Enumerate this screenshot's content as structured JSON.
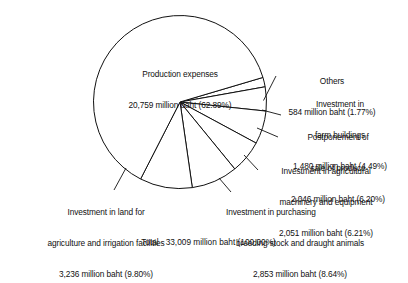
{
  "chart_data": {
    "type": "pie",
    "title": "",
    "unit": "million baht",
    "categories": [
      "Production expenses",
      "Others",
      "Investment in farm buildings",
      "Postponement of sale of produce",
      "Investment in agricultural machinery and equipment",
      "Investment in purchasing breeding stock and draught animals",
      "Investment in land for agriculture and irrigation facilities"
    ],
    "values": [
      20759,
      584,
      1480,
      2046,
      2051,
      2853,
      3236
    ],
    "percentages": [
      62.89,
      1.77,
      4.49,
      6.2,
      6.21,
      8.64,
      9.8
    ],
    "total_value": 33009,
    "total_percentage": 100.0,
    "legend": "none",
    "grid": false,
    "colors": {
      "slice_fill": "#ffffff",
      "outline": "#111111"
    }
  },
  "labels": {
    "production": {
      "line1": "Production expenses",
      "line2": "20,759 million baht (62.89%)"
    },
    "others": {
      "line1": "Others",
      "line2": "584 million baht (1.77%)"
    },
    "farm_buildings": {
      "line1": "Investment in",
      "line2": "farm buildings",
      "line3": "1,480 million baht (4.49%)"
    },
    "postponement": {
      "line1": "Postponement of",
      "line2": "sale of produce",
      "line3": "2,046 million baht (6.20%)"
    },
    "machinery": {
      "line1": "Investment in agricultural",
      "line2": "machinery and equipment",
      "line3": "2,051 million baht (6.21%)"
    },
    "breeding": {
      "line1": "Investment in purchasing",
      "line2": "breeding stock and draught animals",
      "line3": "2,853 million baht (8.64%)"
    },
    "land": {
      "line1": "Investment in land for",
      "line2": "agriculture and irrigation facilities",
      "line3": "3,236 million baht (9.80%)"
    },
    "total": {
      "label": "Total",
      "value": "33,009 million baht (100.00%)"
    }
  }
}
